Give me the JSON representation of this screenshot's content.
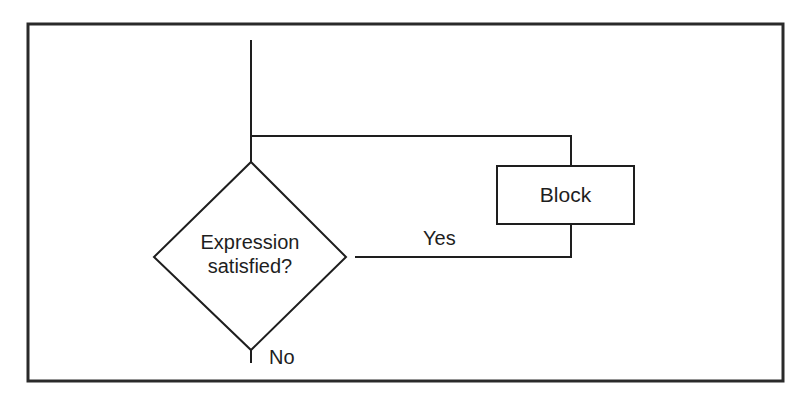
{
  "diagram": {
    "type": "flowchart",
    "colors": {
      "stroke": "#1e1e1e",
      "background": "#ffffff",
      "text": "#1e1e1e"
    },
    "nodes": {
      "decision": {
        "shape": "diamond",
        "line1": "Expression",
        "line2": "satisfied?"
      },
      "block": {
        "shape": "rectangle",
        "label": "Block"
      }
    },
    "edges": {
      "yes_label": "Yes",
      "no_label": "No"
    }
  }
}
